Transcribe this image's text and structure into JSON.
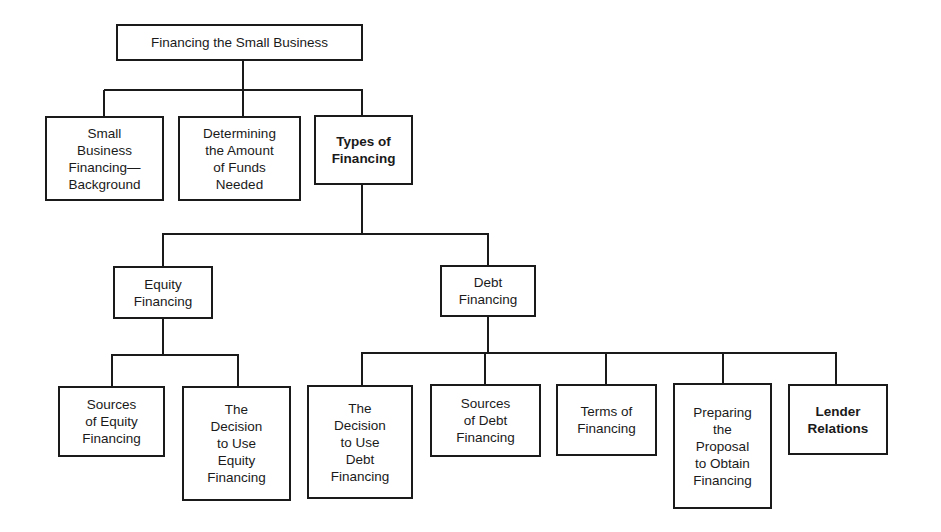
{
  "diagram": {
    "title": "Financing the Small Business",
    "nodes": {
      "root": {
        "label": "Financing the Small Business",
        "emphasis": false
      },
      "background": {
        "label": "Small\nBusiness\nFinancing—\nBackground",
        "emphasis": false
      },
      "determining": {
        "label": "Determining\nthe Amount\nof Funds\nNeeded",
        "emphasis": false
      },
      "types": {
        "label": "Types of\nFinancing",
        "emphasis": true
      },
      "equity": {
        "label": "Equity\nFinancing",
        "emphasis": false
      },
      "debt": {
        "label": "Debt\nFinancing",
        "emphasis": false
      },
      "sources_equity": {
        "label": "Sources\nof Equity\nFinancing",
        "emphasis": false
      },
      "decision_equity": {
        "label": "The\nDecision\nto Use\nEquity\nFinancing",
        "emphasis": false
      },
      "decision_debt": {
        "label": "The\nDecision\nto Use\nDebt\nFinancing",
        "emphasis": false
      },
      "sources_debt": {
        "label": "Sources\nof Debt\nFinancing",
        "emphasis": false
      },
      "terms": {
        "label": "Terms of\nFinancing",
        "emphasis": false
      },
      "preparing": {
        "label": "Preparing\nthe\nProposal\nto Obtain\nFinancing",
        "emphasis": false
      },
      "lender": {
        "label": "Lender\nRelations",
        "emphasis": true
      }
    },
    "edges": [
      [
        "root",
        "background"
      ],
      [
        "root",
        "determining"
      ],
      [
        "root",
        "types"
      ],
      [
        "types",
        "equity"
      ],
      [
        "types",
        "debt"
      ],
      [
        "equity",
        "sources_equity"
      ],
      [
        "equity",
        "decision_equity"
      ],
      [
        "debt",
        "decision_debt"
      ],
      [
        "debt",
        "sources_debt"
      ],
      [
        "debt",
        "terms"
      ],
      [
        "debt",
        "preparing"
      ],
      [
        "debt",
        "lender"
      ]
    ]
  }
}
